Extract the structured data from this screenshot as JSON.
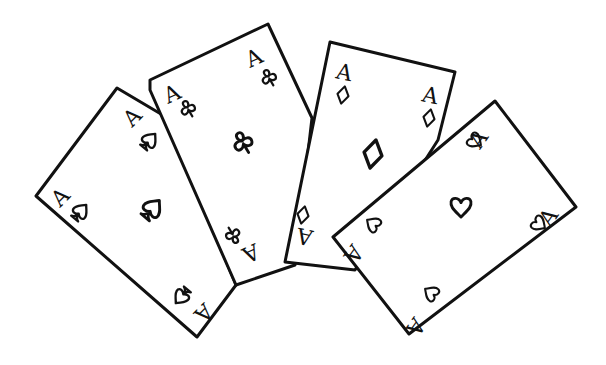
{
  "scene": {
    "description": "Hand-drawn sketch of four ace playing cards fanned out",
    "background": "#ffffff",
    "ink": "#111111"
  },
  "cards": [
    {
      "id": "ace-of-spades",
      "rank": "A",
      "suit": "spade",
      "suit_glyph": "♤"
    },
    {
      "id": "ace-of-clubs",
      "rank": "A",
      "suit": "club",
      "suit_glyph": "♧"
    },
    {
      "id": "ace-of-diamonds",
      "rank": "A",
      "suit": "diamond",
      "suit_glyph": "♢"
    },
    {
      "id": "ace-of-hearts",
      "rank": "A",
      "suit": "heart",
      "suit_glyph": "♡"
    }
  ]
}
